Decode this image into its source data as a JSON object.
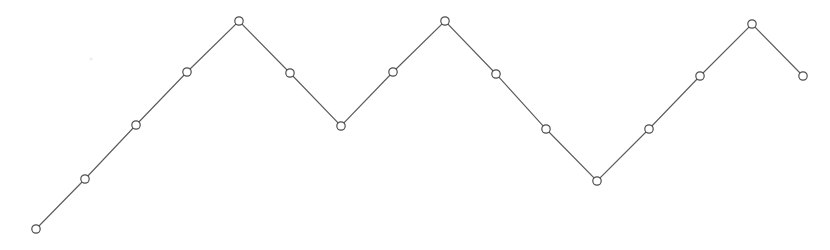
{
  "chart_data": {
    "type": "line",
    "title": "",
    "subtitle": "",
    "xlabel": "",
    "ylabel": "",
    "legend": [],
    "legend_position": "none",
    "grid": false,
    "axes_visible": false,
    "tick_labels_x": [],
    "tick_labels_y": [],
    "xlim": [
      0,
      15
    ],
    "ylim": [
      0,
      5
    ],
    "x": [
      0,
      1,
      2,
      3,
      4,
      5,
      6,
      7,
      8,
      9,
      10,
      11,
      12,
      13,
      14,
      15
    ],
    "series": [
      {
        "name": "series-1",
        "marker": "open-circle",
        "line_style": "solid",
        "color": "#5a5a5a",
        "values": [
          0.25,
          1.25,
          2.3,
          3.35,
          4.4,
          3.35,
          2.3,
          3.35,
          4.4,
          3.3,
          2.25,
          1.2,
          2.25,
          3.3,
          4.35,
          3.3
        ]
      }
    ],
    "pixel_points": [
      {
        "x": 36,
        "y": 229
      },
      {
        "x": 85,
        "y": 179
      },
      {
        "x": 136,
        "y": 125
      },
      {
        "x": 187,
        "y": 72
      },
      {
        "x": 239,
        "y": 21
      },
      {
        "x": 290,
        "y": 73
      },
      {
        "x": 341,
        "y": 126
      },
      {
        "x": 393,
        "y": 72
      },
      {
        "x": 445,
        "y": 21
      },
      {
        "x": 496,
        "y": 74
      },
      {
        "x": 546,
        "y": 129
      },
      {
        "x": 597,
        "y": 181
      },
      {
        "x": 649,
        "y": 129
      },
      {
        "x": 700,
        "y": 76
      },
      {
        "x": 752,
        "y": 24
      },
      {
        "x": 803,
        "y": 76
      }
    ],
    "marker_radius": 4.2,
    "background_color": "#ffffff",
    "line_color": "#5a5a5a",
    "marker_fill": "#ffffff",
    "marker_stroke": "#4e4e4e"
  },
  "accessibility": {
    "description": "Zigzag line chart with 16 open circle markers forming a triangular wave"
  },
  "artifacts": [
    {
      "name": "speck",
      "x": 91,
      "y": 59,
      "r": 1.6
    }
  ]
}
